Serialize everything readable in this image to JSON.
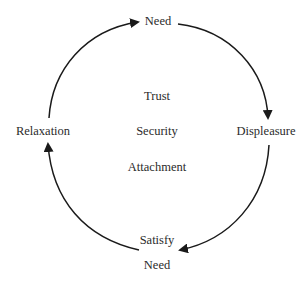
{
  "diagram": {
    "type": "cycle",
    "nodes": {
      "need_top": "Need",
      "displeasure": "Displeasure",
      "satisfy": "Satisfy",
      "need_bottom": "Need",
      "relaxation": "Relaxation"
    },
    "center": {
      "items": [
        "Trust",
        "Security",
        "Attachment"
      ]
    },
    "edges": [
      {
        "from": "Relaxation",
        "to": "Need"
      },
      {
        "from": "Need",
        "to": "Displeasure"
      },
      {
        "from": "Displeasure",
        "to": "Satisfy Need"
      },
      {
        "from": "Satisfy Need",
        "to": "Relaxation"
      }
    ],
    "colors": {
      "stroke": "#1a1a1a",
      "text": "#2b2b2b",
      "background": "#ffffff"
    }
  }
}
